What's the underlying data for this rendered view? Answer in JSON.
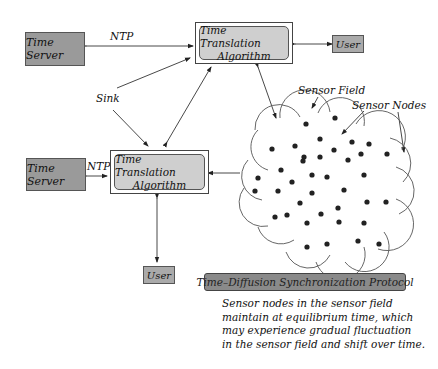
{
  "diagram": {
    "top": {
      "time_server": "Time Server",
      "ntp_label": "NTP",
      "algorithm_line1": "Time Translation",
      "algorithm_line2": "Algorithm",
      "user": "User"
    },
    "sink_label": "Sink",
    "bottom": {
      "time_server": "Time Server",
      "ntp_label": "NTP",
      "algorithm_line1": "Time Translation",
      "algorithm_line2": "Algorithm",
      "user": "User"
    },
    "sensor_field_label": "Sensor Field",
    "sensor_nodes_label": "Sensor Nodes",
    "protocol_label": "Time–Diffusion Synchronization Protocol",
    "description": [
      "Sensor nodes in the sensor field",
      "maintain at equilibrium time, which",
      "may experience gradual fluctuation",
      "in the sensor field and shift over time."
    ],
    "colors": {
      "server_fill": "#9a9a9a",
      "algorithm_fill": "#cfcfcf",
      "user_fill": "#aaaaaa",
      "protocol_fill": "#8a8a8a",
      "node_fill": "#222222"
    },
    "sensor_node_count": 38
  }
}
